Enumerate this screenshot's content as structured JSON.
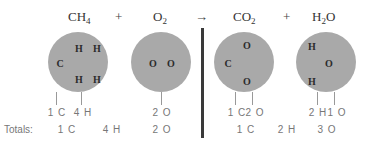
{
  "equation": {
    "reactants": [
      {
        "formula_main": "CH",
        "formula_sub": "4",
        "formula_tail": ""
      },
      {
        "formula_main": "O",
        "formula_sub": "2",
        "formula_tail": ""
      }
    ],
    "products": [
      {
        "formula_main": "CO",
        "formula_sub": "2",
        "formula_tail": ""
      },
      {
        "formula_main": "H",
        "formula_sub": "2",
        "formula_tail": "O"
      }
    ],
    "plus_sign": "+",
    "arrow": "→"
  },
  "molecules": {
    "ch4": {
      "atoms": [
        "C",
        "H",
        "H",
        "H",
        "H"
      ],
      "counts": [
        "1 C",
        "4 H"
      ]
    },
    "o2": {
      "atoms": [
        "O",
        "O"
      ],
      "counts": [
        "2 O"
      ]
    },
    "co2": {
      "atoms": [
        "C",
        "O",
        "O"
      ],
      "counts": [
        "1 C",
        "2 O"
      ]
    },
    "h2o": {
      "atoms": [
        "H",
        "O",
        "H"
      ],
      "counts": [
        "2 H",
        "1 O"
      ]
    }
  },
  "totals": {
    "label": "Totals:",
    "reactants": [
      "1 C",
      "4 H",
      "2 O"
    ],
    "products": [
      "1 C",
      "2 H",
      "3 O"
    ]
  },
  "colors": {
    "circle": "#a9a9a9",
    "divider": "#3a3a3a",
    "count_text": "#777777"
  }
}
